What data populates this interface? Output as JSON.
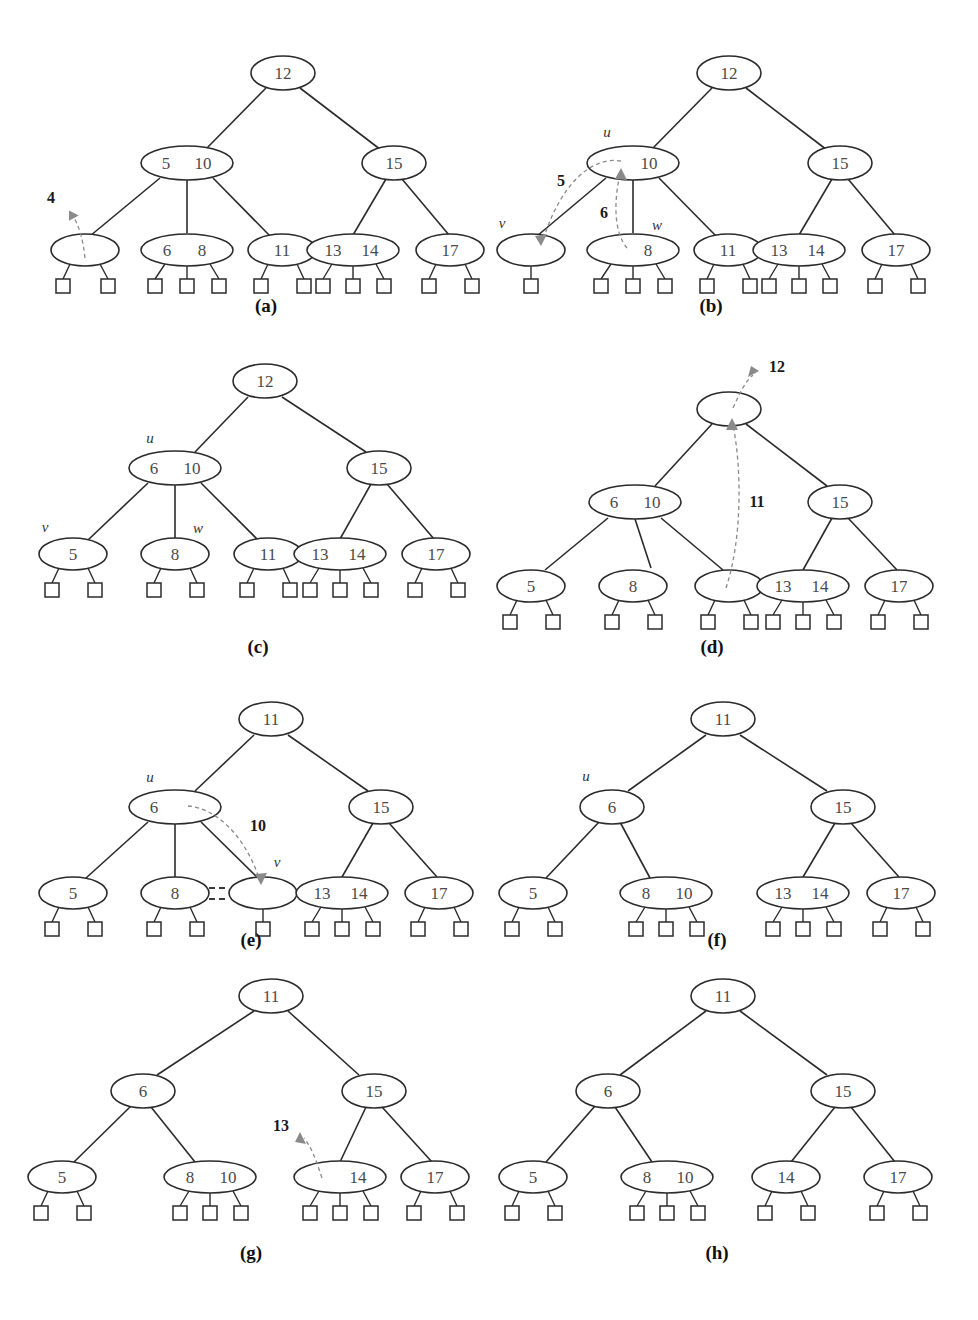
{
  "figure": {
    "title": "",
    "type": "multiway-search-tree-deletion-sequence",
    "background_color": "#ffffff",
    "node_stroke_color": "#2b2b2b",
    "key_text_color": "#4a4a4a",
    "annotation_color": "#8a8a8a"
  },
  "panels": [
    {
      "id": "a",
      "label": "(a)",
      "annotations": [
        {
          "name": "move-4",
          "text": "4",
          "kind": "dashed-arrow-out"
        }
      ],
      "node_labels": [],
      "nodes": [
        {
          "name": "root",
          "keys": [
            "12"
          ],
          "leaves": 0
        },
        {
          "name": "internal-left",
          "keys": [
            "5",
            "10"
          ],
          "leaves": 0
        },
        {
          "name": "internal-right",
          "keys": [
            "15"
          ],
          "leaves": 0
        },
        {
          "name": "leaf-1",
          "keys": [],
          "leaves": 2
        },
        {
          "name": "leaf-2",
          "keys": [
            "6",
            "8"
          ],
          "leaves": 3
        },
        {
          "name": "leaf-3",
          "keys": [
            "11"
          ],
          "leaves": 2
        },
        {
          "name": "leaf-4",
          "keys": [
            "13",
            "14"
          ],
          "leaves": 3
        },
        {
          "name": "leaf-5",
          "keys": [
            "17"
          ],
          "leaves": 2
        }
      ]
    },
    {
      "id": "b",
      "label": "(b)",
      "annotations": [
        {
          "name": "move-5",
          "text": "5",
          "kind": "dashed-arrow"
        },
        {
          "name": "move-6",
          "text": "6",
          "kind": "dashed-arrow"
        }
      ],
      "node_labels": [
        {
          "name": "label-u",
          "text": "u"
        },
        {
          "name": "label-v",
          "text": "v"
        },
        {
          "name": "label-w",
          "text": "w"
        }
      ],
      "nodes": [
        {
          "name": "root",
          "keys": [
            "12"
          ],
          "leaves": 0
        },
        {
          "name": "node-u",
          "keys": [
            "",
            "10"
          ],
          "leaves": 0
        },
        {
          "name": "internal-right",
          "keys": [
            "15"
          ],
          "leaves": 0
        },
        {
          "name": "node-v",
          "keys": [],
          "leaves": 1
        },
        {
          "name": "node-w",
          "keys": [
            "",
            "8"
          ],
          "leaves": 3
        },
        {
          "name": "leaf-3",
          "keys": [
            "11"
          ],
          "leaves": 2
        },
        {
          "name": "leaf-4",
          "keys": [
            "13",
            "14"
          ],
          "leaves": 3
        },
        {
          "name": "leaf-5",
          "keys": [
            "17"
          ],
          "leaves": 2
        }
      ]
    },
    {
      "id": "c",
      "label": "(c)",
      "annotations": [],
      "node_labels": [
        {
          "name": "label-u",
          "text": "u"
        },
        {
          "name": "label-v",
          "text": "v"
        },
        {
          "name": "label-w",
          "text": "w"
        }
      ],
      "nodes": [
        {
          "name": "root",
          "keys": [
            "12"
          ],
          "leaves": 0
        },
        {
          "name": "node-u",
          "keys": [
            "6",
            "10"
          ],
          "leaves": 0
        },
        {
          "name": "internal-right",
          "keys": [
            "15"
          ],
          "leaves": 0
        },
        {
          "name": "node-v",
          "keys": [
            "5"
          ],
          "leaves": 2
        },
        {
          "name": "node-w",
          "keys": [
            "8"
          ],
          "leaves": 2
        },
        {
          "name": "leaf-3",
          "keys": [
            "11"
          ],
          "leaves": 2
        },
        {
          "name": "leaf-4",
          "keys": [
            "13",
            "14"
          ],
          "leaves": 3
        },
        {
          "name": "leaf-5",
          "keys": [
            "17"
          ],
          "leaves": 2
        }
      ]
    },
    {
      "id": "d",
      "label": "(d)",
      "annotations": [
        {
          "name": "move-12",
          "text": "12",
          "kind": "dashed-arrow-out"
        },
        {
          "name": "move-11",
          "text": "11",
          "kind": "dashed-arrow-up"
        }
      ],
      "node_labels": [],
      "nodes": [
        {
          "name": "root",
          "keys": [],
          "leaves": 0
        },
        {
          "name": "internal-left",
          "keys": [
            "6",
            "10"
          ],
          "leaves": 0
        },
        {
          "name": "internal-right",
          "keys": [
            "15"
          ],
          "leaves": 0
        },
        {
          "name": "leaf-1",
          "keys": [
            "5"
          ],
          "leaves": 2
        },
        {
          "name": "leaf-2",
          "keys": [
            "8"
          ],
          "leaves": 2
        },
        {
          "name": "leaf-3",
          "keys": [],
          "leaves": 2
        },
        {
          "name": "leaf-4",
          "keys": [
            "13",
            "14"
          ],
          "leaves": 3
        },
        {
          "name": "leaf-5",
          "keys": [
            "17"
          ],
          "leaves": 2
        }
      ]
    },
    {
      "id": "e",
      "label": "(e)",
      "annotations": [
        {
          "name": "move-10",
          "text": "10",
          "kind": "dashed-arrow"
        },
        {
          "name": "merge-marks",
          "text": "",
          "kind": "fusion-dashes"
        }
      ],
      "node_labels": [
        {
          "name": "label-u",
          "text": "u"
        },
        {
          "name": "label-v",
          "text": "v"
        }
      ],
      "nodes": [
        {
          "name": "root",
          "keys": [
            "11"
          ],
          "leaves": 0
        },
        {
          "name": "node-u",
          "keys": [
            "6",
            ""
          ],
          "leaves": 0
        },
        {
          "name": "internal-right",
          "keys": [
            "15"
          ],
          "leaves": 0
        },
        {
          "name": "leaf-1",
          "keys": [
            "5"
          ],
          "leaves": 2
        },
        {
          "name": "leaf-2",
          "keys": [
            "8"
          ],
          "leaves": 2
        },
        {
          "name": "node-v",
          "keys": [],
          "leaves": 1
        },
        {
          "name": "leaf-4",
          "keys": [
            "13",
            "14"
          ],
          "leaves": 3
        },
        {
          "name": "leaf-5",
          "keys": [
            "17"
          ],
          "leaves": 2
        }
      ]
    },
    {
      "id": "f",
      "label": "(f)",
      "annotations": [],
      "node_labels": [
        {
          "name": "label-u",
          "text": "u"
        }
      ],
      "nodes": [
        {
          "name": "root",
          "keys": [
            "11"
          ],
          "leaves": 0
        },
        {
          "name": "node-u",
          "keys": [
            "6"
          ],
          "leaves": 0
        },
        {
          "name": "internal-right",
          "keys": [
            "15"
          ],
          "leaves": 0
        },
        {
          "name": "leaf-1",
          "keys": [
            "5"
          ],
          "leaves": 2
        },
        {
          "name": "leaf-2",
          "keys": [
            "8",
            "10"
          ],
          "leaves": 3
        },
        {
          "name": "leaf-4",
          "keys": [
            "13",
            "14"
          ],
          "leaves": 3
        },
        {
          "name": "leaf-5",
          "keys": [
            "17"
          ],
          "leaves": 2
        }
      ]
    },
    {
      "id": "g",
      "label": "(g)",
      "annotations": [
        {
          "name": "move-13",
          "text": "13",
          "kind": "dashed-arrow-out"
        }
      ],
      "node_labels": [],
      "nodes": [
        {
          "name": "root",
          "keys": [
            "11"
          ],
          "leaves": 0
        },
        {
          "name": "internal-left",
          "keys": [
            "6"
          ],
          "leaves": 0
        },
        {
          "name": "internal-right",
          "keys": [
            "15"
          ],
          "leaves": 0
        },
        {
          "name": "leaf-1",
          "keys": [
            "5"
          ],
          "leaves": 2
        },
        {
          "name": "leaf-2",
          "keys": [
            "8",
            "10"
          ],
          "leaves": 3
        },
        {
          "name": "leaf-4",
          "keys": [
            "",
            "14"
          ],
          "leaves": 3
        },
        {
          "name": "leaf-5",
          "keys": [
            "17"
          ],
          "leaves": 2
        }
      ]
    },
    {
      "id": "h",
      "label": "(h)",
      "annotations": [],
      "node_labels": [],
      "nodes": [
        {
          "name": "root",
          "keys": [
            "11"
          ],
          "leaves": 0
        },
        {
          "name": "internal-left",
          "keys": [
            "6"
          ],
          "leaves": 0
        },
        {
          "name": "internal-right",
          "keys": [
            "15"
          ],
          "leaves": 0
        },
        {
          "name": "leaf-1",
          "keys": [
            "5"
          ],
          "leaves": 2
        },
        {
          "name": "leaf-2",
          "keys": [
            "8",
            "10"
          ],
          "leaves": 3
        },
        {
          "name": "leaf-4",
          "keys": [
            "14"
          ],
          "leaves": 2
        },
        {
          "name": "leaf-5",
          "keys": [
            "17"
          ],
          "leaves": 2
        }
      ]
    }
  ],
  "keys_text": {
    "k4": "4",
    "k5": "5",
    "k6": "6",
    "k8": "8",
    "k10": "10",
    "k11": "11",
    "k12": "12",
    "k13": "13",
    "k14": "14",
    "k15": "15",
    "k17": "17"
  },
  "panel_labels": {
    "a": "(a)",
    "b": "(b)",
    "c": "(c)",
    "d": "(d)",
    "e": "(e)",
    "f": "(f)",
    "g": "(g)",
    "h": "(h)"
  },
  "variable_labels": {
    "u": "u",
    "v": "v",
    "w": "w"
  }
}
